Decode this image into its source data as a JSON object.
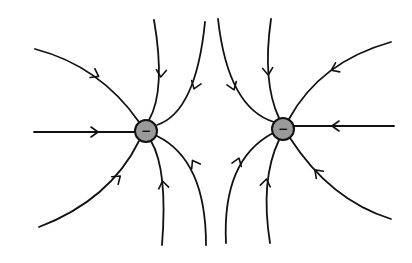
{
  "colors": {
    "background": "#ffffff",
    "line": "#111111",
    "charge_fill": "#9a9a9a"
  },
  "charges": [
    {
      "id": "left",
      "sign": "−",
      "cx": 146,
      "cy": 131,
      "r": 11
    },
    {
      "id": "right",
      "sign": "−",
      "cx": 283,
      "cy": 129,
      "r": 11
    }
  ],
  "field_lines": [
    {
      "charge": "left",
      "name": "left-upper-left",
      "d": "M35,49 Q100,66 139,122",
      "arrow": {
        "x": 96,
        "y": 75,
        "angle": 28
      }
    },
    {
      "charge": "left",
      "name": "left-horizontal",
      "d": "M34,132 L135,132",
      "arrow": {
        "x": 95,
        "y": 132,
        "angle": 0
      }
    },
    {
      "charge": "left",
      "name": "left-lower-left",
      "d": "M39,227 Q110,200 139,141",
      "arrow": {
        "x": 118,
        "y": 178,
        "angle": -40
      }
    },
    {
      "charge": "left",
      "name": "left-top-1",
      "d": "M154,20 Q166,90 149,120",
      "arrow": {
        "x": 161,
        "y": 74,
        "angle": 95
      }
    },
    {
      "charge": "left",
      "name": "left-top-2",
      "d": "M205,22 Q196,112 157,125",
      "arrow": {
        "x": 195,
        "y": 86,
        "angle": 110
      }
    },
    {
      "charge": "left",
      "name": "left-bottom-1",
      "d": "M162,245 Q168,170 151,141",
      "arrow": {
        "x": 163,
        "y": 184,
        "angle": -100
      }
    },
    {
      "charge": "left",
      "name": "left-bottom-2",
      "d": "M206,245 Q206,160 157,136",
      "arrow": {
        "x": 194,
        "y": 163,
        "angle": -120
      }
    }
  ],
  "field_lines_right": [
    {
      "charge": "right",
      "name": "right-top-1",
      "d": "M218,19 Q228,108 274,122",
      "arrow": {
        "x": 233,
        "y": 87,
        "angle": 70
      }
    },
    {
      "charge": "right",
      "name": "right-top-2",
      "d": "M271,19 Q262,82 279,118",
      "arrow": {
        "x": 268,
        "y": 72,
        "angle": 85
      }
    },
    {
      "charge": "right",
      "name": "right-upper-right",
      "d": "M391,42 Q320,62 289,119",
      "arrow": {
        "x": 334,
        "y": 69,
        "angle": 155
      }
    },
    {
      "charge": "right",
      "name": "right-horizontal",
      "d": "M394,126 L294,126",
      "arrow": {
        "x": 335,
        "y": 126,
        "angle": 180
      }
    },
    {
      "charge": "right",
      "name": "right-lower-right",
      "d": "M391,219 Q330,200 290,138",
      "arrow": {
        "x": 317,
        "y": 172,
        "angle": -135
      }
    },
    {
      "charge": "right",
      "name": "right-bottom-1",
      "d": "M226,243 Q222,160 273,133",
      "arrow": {
        "x": 238,
        "y": 161,
        "angle": -70
      }
    },
    {
      "charge": "right",
      "name": "right-bottom-2",
      "d": "M270,243 Q260,180 279,140",
      "arrow": {
        "x": 266,
        "y": 182,
        "angle": -80
      }
    }
  ]
}
